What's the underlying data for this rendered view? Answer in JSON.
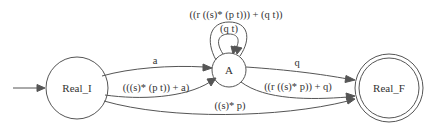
{
  "diagram": {
    "type": "finite-state-automaton",
    "colors": {
      "stroke": "#555555",
      "text": "#333333",
      "background": "#ffffff"
    },
    "nodes": [
      {
        "id": "Real_I",
        "label": "Real_I",
        "initial": true,
        "accepting": false
      },
      {
        "id": "A",
        "label": "A",
        "initial": false,
        "accepting": false
      },
      {
        "id": "Real_F",
        "label": "Real_F",
        "initial": false,
        "accepting": true
      }
    ],
    "edges": [
      {
        "from": "Real_I",
        "to": "A",
        "label": "a"
      },
      {
        "from": "Real_I",
        "to": "A",
        "label": "(((s)* (p t)) + a)"
      },
      {
        "from": "A",
        "to": "A",
        "label": "(q t)"
      },
      {
        "from": "A",
        "to": "A",
        "label": "((r ((s)* (p t))) + (q t))"
      },
      {
        "from": "A",
        "to": "Real_F",
        "label": "q"
      },
      {
        "from": "A",
        "to": "Real_F",
        "label": "((r ((s)* p)) + q)"
      },
      {
        "from": "Real_I",
        "to": "Real_F",
        "label": "((s)* p)"
      }
    ]
  }
}
